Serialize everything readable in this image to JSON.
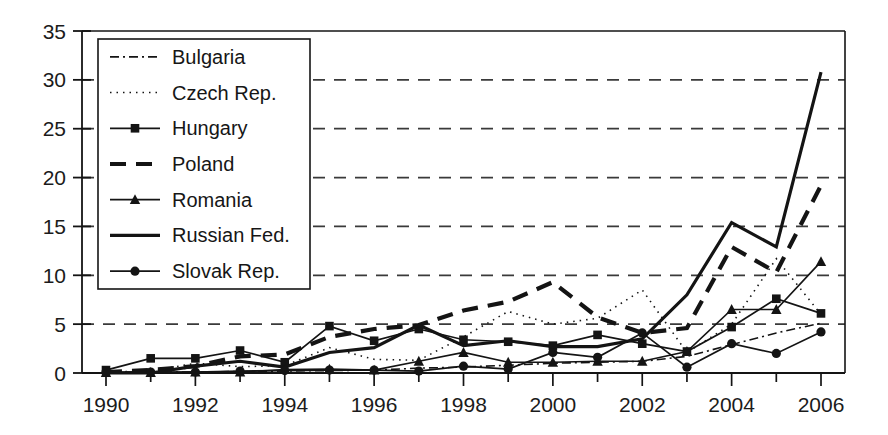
{
  "chart_data": {
    "type": "line",
    "title": "",
    "subtitle": "",
    "xlabel": "",
    "ylabel": "",
    "xlim": [
      1990,
      2006
    ],
    "ylim": [
      0,
      35
    ],
    "ytick_step": 5,
    "xtick_step": 2,
    "grid": "horizontal-dashed",
    "legend_position": "upper-left-inside",
    "x": [
      1990,
      1991,
      1992,
      1993,
      1994,
      1995,
      1996,
      1997,
      1998,
      1999,
      2000,
      2001,
      2002,
      2003,
      2004,
      2005,
      2006
    ],
    "xticklabels": [
      "1990",
      "1992",
      "1994",
      "1996",
      "1998",
      "2000",
      "2002",
      "2004",
      "2006"
    ],
    "yticklabels": [
      "0",
      "5",
      "10",
      "15",
      "20",
      "25",
      "30",
      "35"
    ],
    "series": [
      {
        "name": "Bulgaria",
        "style": "dash-dot",
        "marker": "none",
        "width": 1.6,
        "values": [
          0.1,
          0.1,
          0.1,
          0.15,
          0.2,
          0.25,
          0.3,
          0.5,
          0.6,
          0.8,
          1.0,
          1.1,
          1.2,
          1.7,
          2.9,
          4.1,
          5.1
        ]
      },
      {
        "name": "Czech Rep.",
        "style": "dotted",
        "marker": "none",
        "width": 1.6,
        "values": [
          0.1,
          0.2,
          1.0,
          0.65,
          0.75,
          2.6,
          1.4,
          1.3,
          3.7,
          6.3,
          5.0,
          5.6,
          8.5,
          2.1,
          5.0,
          11.7,
          6.0
        ]
      },
      {
        "name": "Hungary",
        "style": "solid",
        "marker": "square",
        "width": 1.7,
        "values": [
          0.3,
          1.5,
          1.5,
          2.3,
          1.1,
          4.8,
          3.3,
          4.5,
          3.4,
          3.2,
          2.8,
          3.9,
          3.0,
          2.2,
          4.7,
          7.6,
          6.1
        ]
      },
      {
        "name": "Poland",
        "style": "dashed-thick",
        "marker": "none",
        "width": 4.2,
        "values": [
          0.1,
          0.3,
          0.7,
          1.7,
          1.9,
          3.7,
          4.5,
          4.9,
          6.4,
          7.3,
          9.3,
          5.7,
          4.1,
          4.6,
          12.9,
          10.3,
          19.2
        ]
      },
      {
        "name": "Romania",
        "style": "solid",
        "marker": "triangle",
        "width": 1.7,
        "values": [
          0.05,
          0.05,
          0.1,
          0.1,
          0.35,
          0.4,
          0.3,
          1.2,
          2.1,
          1.1,
          1.1,
          1.2,
          1.2,
          2.2,
          6.5,
          6.5,
          11.4
        ]
      },
      {
        "name": "Russian Fed.",
        "style": "solid-thick",
        "marker": "none",
        "width": 3.2,
        "values": [
          0.0,
          0.0,
          0.7,
          1.2,
          0.6,
          2.1,
          2.6,
          4.9,
          2.8,
          3.3,
          2.7,
          2.7,
          3.5,
          8.0,
          15.4,
          12.9,
          30.8
        ]
      },
      {
        "name": "Slovak Rep.",
        "style": "solid",
        "marker": "circle",
        "width": 1.7,
        "values": [
          0.1,
          0.1,
          0.1,
          0.2,
          0.25,
          0.3,
          0.3,
          0.2,
          0.7,
          0.4,
          2.1,
          1.6,
          4.1,
          0.6,
          3.0,
          2.0,
          4.2
        ]
      }
    ]
  },
  "legend": {
    "entries": [
      {
        "label": "Bulgaria"
      },
      {
        "label": "Czech Rep."
      },
      {
        "label": "Hungary"
      },
      {
        "label": "Poland"
      },
      {
        "label": "Romania"
      },
      {
        "label": "Russian Fed."
      },
      {
        "label": "Slovak Rep."
      }
    ]
  },
  "colors": {
    "line": "#141414",
    "grid": "#3a3a3a",
    "axis": "#141414",
    "background": "#ffffff"
  }
}
